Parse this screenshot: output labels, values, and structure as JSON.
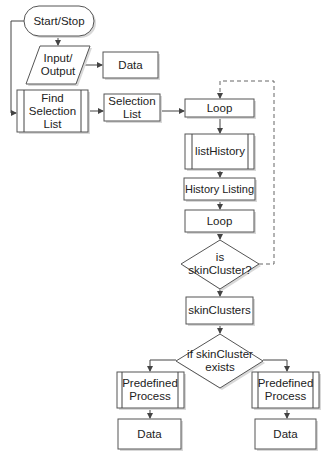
{
  "diagram": {
    "type": "flowchart",
    "nodes": {
      "start_stop": {
        "label": "Start/Stop",
        "shape": "terminator"
      },
      "input_output": {
        "label": "Input/ Output",
        "shape": "parallelogram"
      },
      "data_top": {
        "label": "Data",
        "shape": "rectangle"
      },
      "find_selection_list": {
        "label": "Find Selection List",
        "shape": "predefined-process"
      },
      "selection_list": {
        "label": "Selection List",
        "shape": "rectangle"
      },
      "loop_start": {
        "label": "Loop",
        "shape": "rectangle"
      },
      "list_history": {
        "label": "listHistory",
        "shape": "predefined-process"
      },
      "history_listing": {
        "label": "History Listing",
        "shape": "rectangle"
      },
      "loop_end": {
        "label": "Loop",
        "shape": "rectangle"
      },
      "is_skincluster": {
        "label": "is skinCluster?",
        "shape": "decision"
      },
      "skinclusters": {
        "label": "skinClusters",
        "shape": "rectangle"
      },
      "if_skincluster_exists": {
        "label": "if skinCluster exists",
        "shape": "decision"
      },
      "predefined_left": {
        "label": "Predefined Process",
        "shape": "predefined-process"
      },
      "predefined_right": {
        "label": "Predefined Process",
        "shape": "predefined-process"
      },
      "data_left": {
        "label": "Data",
        "shape": "rectangle"
      },
      "data_right": {
        "label": "Data",
        "shape": "rectangle"
      }
    },
    "edges": [
      [
        "start_stop",
        "input_output"
      ],
      [
        "start_stop",
        "find_selection_list"
      ],
      [
        "input_output",
        "data_top"
      ],
      [
        "find_selection_list",
        "selection_list"
      ],
      [
        "selection_list",
        "loop_start"
      ],
      [
        "loop_start",
        "list_history"
      ],
      [
        "list_history",
        "history_listing"
      ],
      [
        "history_listing",
        "loop_end"
      ],
      [
        "loop_end",
        "is_skincluster"
      ],
      [
        "is_skincluster",
        "loop_start",
        "dashed"
      ],
      [
        "is_skincluster",
        "skinclusters"
      ],
      [
        "skinclusters",
        "if_skincluster_exists"
      ],
      [
        "if_skincluster_exists",
        "predefined_left"
      ],
      [
        "if_skincluster_exists",
        "predefined_right"
      ],
      [
        "predefined_left",
        "data_left"
      ],
      [
        "predefined_right",
        "data_right"
      ]
    ]
  }
}
